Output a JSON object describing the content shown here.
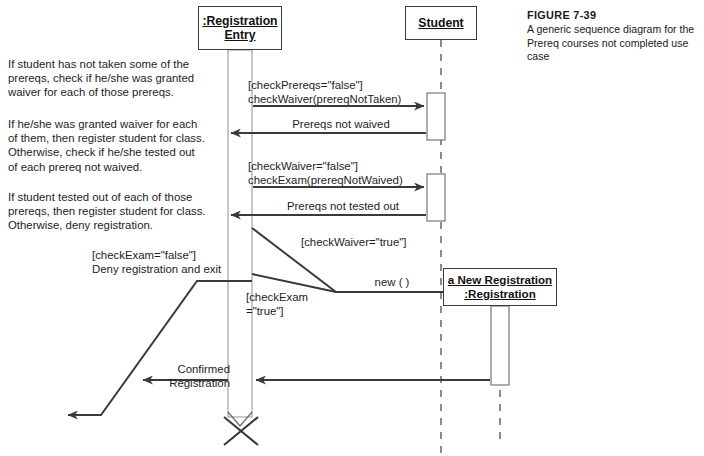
{
  "figure": {
    "title": "FIGURE 7-39",
    "description": "A generic sequence diagram for the\nPrereq courses not completed use case"
  },
  "notes": [
    {
      "id": "note-1",
      "text": "If student has not taken some of the\nprereqs, check if he/she was granted\nwaiver for each of those prereqs."
    },
    {
      "id": "note-2",
      "text": "If he/she was granted waiver for each\nof them, then register student for class.\nOtherwise, check if he/she tested out\nof each prereq not waived."
    },
    {
      "id": "note-3",
      "text": "If student tested out of each of those\nprereqs, then register student for class.\nOtherwise, deny registration."
    }
  ],
  "objects": [
    {
      "id": "registration-entry",
      "line1": ":Registration",
      "line2": "Entry"
    },
    {
      "id": "student",
      "line1": "Student",
      "line2": ""
    },
    {
      "id": "new-registration",
      "line1": "a New Registration",
      "line2": ":Registration"
    }
  ],
  "messages": [
    {
      "id": "check-waiver",
      "label": "[checkPrereqs=\"false\"]\ncheckWaiver(prereqNotTaken)"
    },
    {
      "id": "prereqs-not-waived",
      "label": "Prereqs not waived"
    },
    {
      "id": "check-exam",
      "label": "[checkWaiver=\"false\"]\ncheckExam(prereqNotWaived)"
    },
    {
      "id": "prereqs-not-tested-out",
      "label": "Prereqs not tested out"
    },
    {
      "id": "check-waiver-true",
      "label": "[checkWaiver=\"true\"]"
    },
    {
      "id": "new-call",
      "label": "new ( )"
    },
    {
      "id": "check-exam-true",
      "label": "[checkExam\n=\"true\"]"
    },
    {
      "id": "check-exam-false",
      "label": "[checkExam=\"false\"]\nDeny registration and exit"
    },
    {
      "id": "confirmed-registration",
      "label": "Confirmed\nRegistration"
    }
  ],
  "colors": {
    "line": "#3a3a3a",
    "lifeline": "#9b9b9b",
    "text": "#1d1d1d",
    "background": "#ffffff"
  }
}
